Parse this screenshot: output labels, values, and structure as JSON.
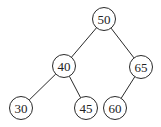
{
  "diagram": {
    "type": "binary-search-tree",
    "node_radius": 11.5,
    "nodes": [
      {
        "id": "n50",
        "label": "50",
        "x": 104,
        "y": 19
      },
      {
        "id": "n40",
        "label": "40",
        "x": 64,
        "y": 66
      },
      {
        "id": "n65",
        "label": "65",
        "x": 141,
        "y": 67
      },
      {
        "id": "n30",
        "label": "30",
        "x": 21,
        "y": 108
      },
      {
        "id": "n45",
        "label": "45",
        "x": 86,
        "y": 108
      },
      {
        "id": "n60",
        "label": "60",
        "x": 115,
        "y": 108
      }
    ],
    "edges": [
      {
        "from": "n50",
        "to": "n40"
      },
      {
        "from": "n50",
        "to": "n65"
      },
      {
        "from": "n40",
        "to": "n30"
      },
      {
        "from": "n40",
        "to": "n45"
      },
      {
        "from": "n65",
        "to": "n60"
      }
    ],
    "colors": {
      "stroke": "#2a2a2a",
      "text": "#222222",
      "background": "#ffffff"
    }
  }
}
